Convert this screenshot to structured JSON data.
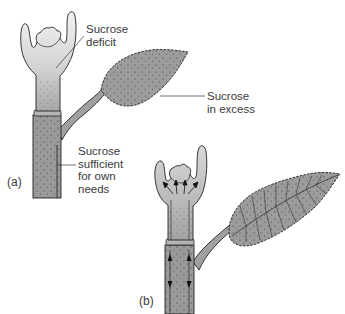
{
  "diagram": {
    "panels": [
      {
        "id": "a",
        "label": "(a)",
        "annotations": [
          {
            "id": "apex",
            "line1": "Sucrose",
            "line2": "deficit"
          },
          {
            "id": "leaf",
            "line1": "Sucrose",
            "line2": "in excess"
          },
          {
            "id": "stem",
            "line1": "Sucrose",
            "line2": "sufficient",
            "line3": "for own",
            "line4": "needs"
          }
        ]
      },
      {
        "id": "b",
        "label": "(b)",
        "arrows": "Arrows show sucrose transport up the stem to the apex and down the stem"
      }
    ],
    "colors": {
      "tissue_fill": "#9a9a9a",
      "tissue_light": "#d8d8d8",
      "outline": "#222222",
      "text": "#3a3a3a"
    }
  }
}
